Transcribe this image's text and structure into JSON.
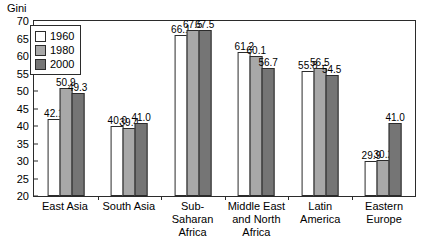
{
  "chart_data": {
    "type": "bar",
    "title": "",
    "xlabel": "",
    "ylabel": "Gini",
    "ylim": [
      20,
      70
    ],
    "yticks": [
      70,
      65,
      60,
      55,
      50,
      45,
      40,
      35,
      30,
      25,
      20
    ],
    "grid": false,
    "legend_position": "top-left",
    "categories": [
      "East Asia",
      "South Asia",
      "Sub-Saharan\nAfrica",
      "Middle East\nand North Africa",
      "Latin\nAmerica",
      "Eastern\nEurope"
    ],
    "series": [
      {
        "name": "1960",
        "color": "#ffffff",
        "values": [
          42.1,
          40.0,
          66.1,
          61.2,
          55.8,
          29.9
        ]
      },
      {
        "name": "1980",
        "color": "#a8a8a8",
        "values": [
          50.9,
          39.4,
          67.5,
          60.1,
          56.5,
          30.2
        ]
      },
      {
        "name": "2000",
        "color": "#757575",
        "values": [
          49.3,
          41.0,
          67.5,
          56.7,
          54.5,
          41.0
        ]
      }
    ],
    "value_labels": [
      [
        "42.1",
        "50.9",
        "49.3"
      ],
      [
        "40.0",
        "39.4",
        "41.0"
      ],
      [
        "66.1",
        "67.5",
        "67.5"
      ],
      [
        "61.2",
        "60.1",
        "56.7"
      ],
      [
        "55.8",
        "56.5",
        "54.5"
      ],
      [
        "29.9",
        "30.2",
        "41.0"
      ]
    ]
  },
  "legend": {
    "items": [
      {
        "label": "1960"
      },
      {
        "label": "1980"
      },
      {
        "label": "2000"
      }
    ]
  },
  "colors": {
    "series_1960": "#ffffff",
    "series_1980": "#a8a8a8",
    "series_2000": "#757575",
    "axis": "#2b2b2b",
    "background": "#ffffff"
  }
}
